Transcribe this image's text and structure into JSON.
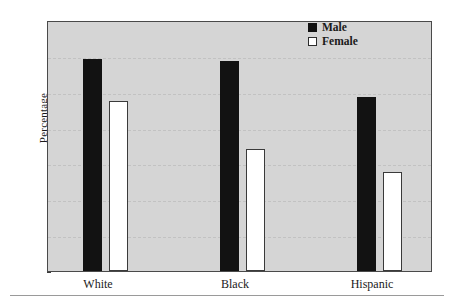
{
  "chart_data": {
    "type": "bar",
    "title": "",
    "xlabel": "",
    "ylabel": "Percentage",
    "categories": [
      "White",
      "Black",
      "Hispanic"
    ],
    "series": [
      {
        "name": "Male",
        "values": [
          59.0,
          58.5,
          48.5
        ]
      },
      {
        "name": "Female",
        "values": [
          47.5,
          34.0,
          27.5
        ]
      }
    ],
    "ylim": [
      0,
      70
    ],
    "yticks": [
      0,
      10,
      20,
      30,
      40,
      50,
      60,
      70
    ],
    "ytick_labels": [
      "0",
      "10",
      "20",
      "30",
      "40",
      "50",
      "60",
      "70"
    ],
    "grid": true,
    "grid_style": "dashed",
    "legend_position": "top-right",
    "colors": {
      "male": "#121212",
      "female": "#ffffff",
      "plot_background": "#d5d5d5",
      "frame": "#4a4a4a",
      "gridline": "#c2c2c2",
      "page_background": "#ffffff"
    }
  },
  "legend": {
    "items": [
      {
        "label": "Male",
        "swatch": "filled-square-icon"
      },
      {
        "label": "Female",
        "swatch": "empty-square-icon"
      }
    ]
  }
}
